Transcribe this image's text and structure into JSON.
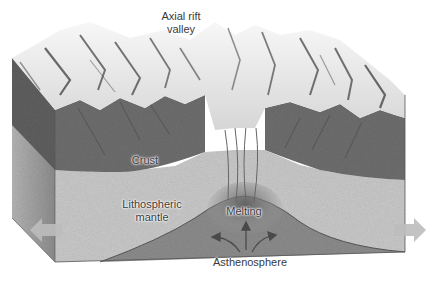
{
  "diagram": {
    "labels": {
      "axial_rift_valley_line1": "Axial rift",
      "axial_rift_valley_line2": "valley",
      "crust": "Crust",
      "lithospheric_mantle_line1": "Lithospheric",
      "lithospheric_mantle_line2": "mantle",
      "melting": "Melting",
      "asthenosphere": "Asthenosphere"
    },
    "arrows": {
      "left": "plate-motion-left-arrow",
      "right": "plate-motion-right-arrow",
      "upwelling": [
        "arrow-up",
        "arrow-up-left",
        "arrow-up-right"
      ]
    },
    "colors": {
      "background": "#ffffff",
      "crust": "#6e6e6e",
      "lithospheric_mantle": "#c9c9c9",
      "asthenosphere": "#8c8c8c",
      "melting_zone": "#7a7a7a",
      "side_face": "#9a9a9a",
      "terrain_light": "#f2f2f2",
      "terrain_dark": "#3c3c3c",
      "arrow_fill": "#bdbdbd"
    }
  }
}
